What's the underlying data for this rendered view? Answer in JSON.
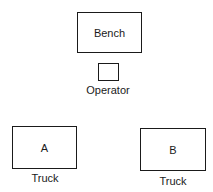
{
  "diagram": {
    "bench": {
      "label": "Bench"
    },
    "operator": {
      "label": "",
      "caption": "Operator"
    },
    "truck_a": {
      "label": "A",
      "caption": "Truck"
    },
    "truck_b": {
      "label": "B",
      "caption": "Truck"
    }
  }
}
